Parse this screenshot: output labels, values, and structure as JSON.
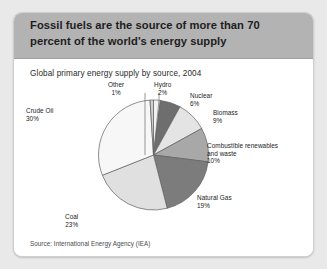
{
  "card": {
    "headline": "Fossil fuels are the source of more than 70 percent of the world's energy supply",
    "subtitle": "Global primary energy supply by source, 2004",
    "source": "Source: International Energy Agency (IEA)"
  },
  "colors": {
    "page_background": "#e9e9e9",
    "header_band": "#b3b3b3",
    "card_background": "#ffffff",
    "text": "#1c1c1c"
  },
  "chart_data": {
    "type": "pie",
    "title": "Global primary energy supply by source, 2004",
    "subtitle": "",
    "xlabel": "",
    "ylabel": "",
    "legend_position": "callout-labels",
    "grid": false,
    "start_angle_deg": 0,
    "direction": "clockwise",
    "units": "percent",
    "categories": [
      "Hydro",
      "Nuclear",
      "Biomass",
      "Combustible renewables and waste",
      "Natural Gas",
      "Coal",
      "Crude Oil",
      "Other"
    ],
    "values": [
      2,
      6,
      9,
      10,
      19,
      23,
      30,
      1
    ],
    "slice_colors": [
      "#f2f2f2",
      "#6e6e6e",
      "#e4e4e4",
      "#a8a8a8",
      "#7c7c7c",
      "#e0e0e0",
      "#f7f7f7",
      "#d0d0d0"
    ],
    "slices": [
      {
        "name": "Hydro",
        "pct": 2,
        "label": "Hydro",
        "pct_label": "2%",
        "color": "#f2f2f2"
      },
      {
        "name": "Nuclear",
        "pct": 6,
        "label": "Nuclear",
        "pct_label": "6%",
        "color": "#6e6e6e"
      },
      {
        "name": "Biomass",
        "pct": 9,
        "label": "Biomass",
        "pct_label": "9%",
        "color": "#e4e4e4"
      },
      {
        "name": "Combustible renewables and waste",
        "pct": 10,
        "label_line1": "Combustible renewables",
        "label_line2": "and waste",
        "pct_label": "10%",
        "color": "#a8a8a8"
      },
      {
        "name": "Natural Gas",
        "pct": 19,
        "label": "Natural Gas",
        "pct_label": "19%",
        "color": "#7c7c7c"
      },
      {
        "name": "Coal",
        "pct": 23,
        "label": "Coal",
        "pct_label": "23%",
        "color": "#e0e0e0"
      },
      {
        "name": "Crude Oil",
        "pct": 30,
        "label": "Crude Oil",
        "pct_label": "30%",
        "color": "#f7f7f7"
      },
      {
        "name": "Other",
        "pct": 1,
        "label": "Other",
        "pct_label": "1%",
        "color": "#d0d0d0"
      }
    ]
  }
}
